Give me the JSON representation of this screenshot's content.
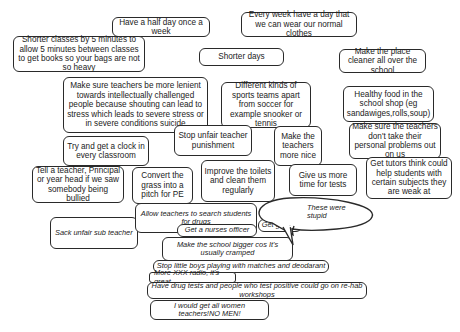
{
  "suggestions": [
    {
      "id": "half-day",
      "text": "Have a half day once a week"
    },
    {
      "id": "normal-clothes",
      "text": "Every week have a day that we can wear our normal clothes"
    },
    {
      "id": "shorter-classes",
      "text": "Shorter classes by 5 minutes to allow 5 minutes between classes to get books so your bags are not so heavy"
    },
    {
      "id": "shorter-days",
      "text": "Shorter days"
    },
    {
      "id": "cleaner",
      "text": "Make the place cleaner all over the school"
    },
    {
      "id": "lenient-teachers",
      "text": "Make sure teachers be more lenient towards intellectually challenged people because shouting can lead to stress which leads to severe stress or in severe conditions suicide"
    },
    {
      "id": "sports",
      "text": "Different kinds of sports teams apart from soccer for example snooker or tennis"
    },
    {
      "id": "healthy-food",
      "text": "Healthy food in the school shop (eg sandawiges,rolls,soup)"
    },
    {
      "id": "unfair-punishment",
      "text": "Stop unfair teacher punishment"
    },
    {
      "id": "nicer-teachers",
      "text": "Make the teachers more nice"
    },
    {
      "id": "personal-problems",
      "text": "Make sure the teachers don't take their personal problems out on us"
    },
    {
      "id": "clock",
      "text": "Try and get a clock in every classroom"
    },
    {
      "id": "bullied",
      "text": "Tell a teacher, Principal or year head if we saw somebody being bullied"
    },
    {
      "id": "pitch",
      "text": "Convert the grass into a pitch for PE"
    },
    {
      "id": "toilets",
      "text": "Improve the toilets and clean them regularly"
    },
    {
      "id": "tests-time",
      "text": "Give us more time for tests"
    },
    {
      "id": "tutors",
      "text": "Get tutors think could help students with certain subjects they are weak at"
    }
  ],
  "stupid_suggestions": [
    {
      "id": "search-drugs",
      "text": "Allow teachers to search students for drugs"
    },
    {
      "id": "sub-teacher",
      "text": "Sack unfair sub teacher"
    },
    {
      "id": "gutters",
      "text": "Get gutters"
    },
    {
      "id": "nurses",
      "text": "Get a nurses officer"
    },
    {
      "id": "bigger-school",
      "text": "Make the school bigger cos It's usually cramped"
    },
    {
      "id": "little-boys",
      "text": "Stop little boys playing with matches and deodarant"
    },
    {
      "id": "radio",
      "text": "More XXX radio, it's great"
    },
    {
      "id": "drug-tests",
      "text": "Have drug tests and people who test positive could go on re-hab workshops"
    },
    {
      "id": "women-teachers",
      "text": "I would get all women teachers!NO MEN!"
    }
  ],
  "callout": {
    "text": "These were stupid"
  }
}
